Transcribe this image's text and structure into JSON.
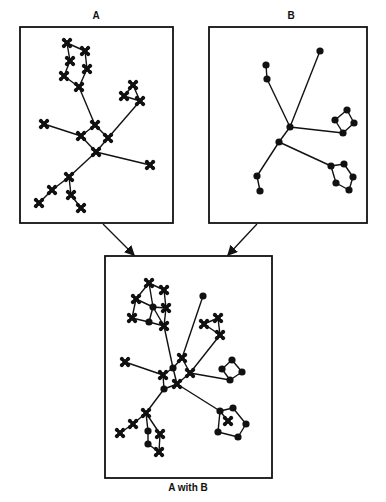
{
  "diagram": {
    "colors": {
      "ink": "#111111",
      "background": "#ffffff"
    },
    "panels": [
      {
        "id": "A",
        "label": "A",
        "box": [
          20,
          27,
          153,
          196
        ],
        "label_pos": [
          96,
          17
        ],
        "nodes": [
          {
            "x": 67,
            "y": 43,
            "t": "x"
          },
          {
            "x": 85,
            "y": 51,
            "t": "x"
          },
          {
            "x": 70,
            "y": 61,
            "t": "x"
          },
          {
            "x": 87,
            "y": 69,
            "t": "x"
          },
          {
            "x": 64,
            "y": 76,
            "t": "x"
          },
          {
            "x": 79,
            "y": 87,
            "t": "x"
          },
          {
            "x": 133,
            "y": 85,
            "t": "x"
          },
          {
            "x": 124,
            "y": 96,
            "t": "x"
          },
          {
            "x": 140,
            "y": 101,
            "t": "x"
          },
          {
            "x": 95,
            "y": 125,
            "t": "x"
          },
          {
            "x": 81,
            "y": 136,
            "t": "x"
          },
          {
            "x": 108,
            "y": 138,
            "t": "x"
          },
          {
            "x": 96,
            "y": 152,
            "t": "x"
          },
          {
            "x": 44,
            "y": 124,
            "t": "x"
          },
          {
            "x": 150,
            "y": 165,
            "t": "x"
          },
          {
            "x": 69,
            "y": 177,
            "t": "x"
          },
          {
            "x": 52,
            "y": 190,
            "t": "x"
          },
          {
            "x": 39,
            "y": 203,
            "t": "x"
          },
          {
            "x": 71,
            "y": 195,
            "t": "x"
          },
          {
            "x": 81,
            "y": 208,
            "t": "x"
          }
        ],
        "edges": [
          [
            0,
            1
          ],
          [
            1,
            3
          ],
          [
            3,
            5
          ],
          [
            5,
            4
          ],
          [
            4,
            2
          ],
          [
            2,
            0
          ],
          [
            5,
            9
          ],
          [
            6,
            7
          ],
          [
            7,
            8
          ],
          [
            8,
            6
          ],
          [
            8,
            11
          ],
          [
            9,
            10
          ],
          [
            9,
            11
          ],
          [
            10,
            12
          ],
          [
            11,
            12
          ],
          [
            10,
            13
          ],
          [
            12,
            14
          ],
          [
            12,
            15
          ],
          [
            15,
            16
          ],
          [
            16,
            17
          ],
          [
            15,
            18
          ],
          [
            18,
            19
          ]
        ]
      },
      {
        "id": "B",
        "label": "B",
        "box": [
          209,
          27,
          158,
          196
        ],
        "label_pos": [
          291,
          17
        ],
        "nodes": [
          {
            "x": 290,
            "y": 127,
            "t": "o"
          },
          {
            "x": 279,
            "y": 142,
            "t": "o"
          },
          {
            "x": 320,
            "y": 51,
            "t": "o"
          },
          {
            "x": 266,
            "y": 65,
            "t": "o"
          },
          {
            "x": 267,
            "y": 79,
            "t": "o"
          },
          {
            "x": 347,
            "y": 110,
            "t": "o"
          },
          {
            "x": 335,
            "y": 120,
            "t": "o"
          },
          {
            "x": 354,
            "y": 123,
            "t": "o"
          },
          {
            "x": 343,
            "y": 133,
            "t": "o"
          },
          {
            "x": 331,
            "y": 166,
            "t": "o"
          },
          {
            "x": 344,
            "y": 164,
            "t": "o"
          },
          {
            "x": 353,
            "y": 177,
            "t": "o"
          },
          {
            "x": 349,
            "y": 190,
            "t": "o"
          },
          {
            "x": 336,
            "y": 183,
            "t": "o"
          },
          {
            "x": 257,
            "y": 176,
            "t": "o"
          },
          {
            "x": 260,
            "y": 191,
            "t": "o"
          }
        ],
        "edges": [
          [
            0,
            1
          ],
          [
            0,
            2
          ],
          [
            0,
            4
          ],
          [
            3,
            4
          ],
          [
            0,
            8
          ],
          [
            5,
            6
          ],
          [
            6,
            8
          ],
          [
            8,
            7
          ],
          [
            7,
            5
          ],
          [
            1,
            9
          ],
          [
            9,
            10
          ],
          [
            10,
            11
          ],
          [
            11,
            12
          ],
          [
            12,
            13
          ],
          [
            13,
            9
          ],
          [
            1,
            14
          ],
          [
            14,
            15
          ]
        ]
      },
      {
        "id": "AB",
        "label": "A with B",
        "box": [
          105,
          256,
          167,
          222
        ],
        "label_pos": [
          188,
          488
        ],
        "nodes": [
          {
            "x": 149,
            "y": 283,
            "t": "x"
          },
          {
            "x": 164,
            "y": 290,
            "t": "x"
          },
          {
            "x": 136,
            "y": 299,
            "t": "x"
          },
          {
            "x": 153,
            "y": 307,
            "t": "o"
          },
          {
            "x": 166,
            "y": 308,
            "t": "x"
          },
          {
            "x": 132,
            "y": 318,
            "t": "x"
          },
          {
            "x": 149,
            "y": 322,
            "t": "o"
          },
          {
            "x": 164,
            "y": 326,
            "t": "x"
          },
          {
            "x": 203,
            "y": 296,
            "t": "o"
          },
          {
            "x": 218,
            "y": 318,
            "t": "x"
          },
          {
            "x": 204,
            "y": 324,
            "t": "x"
          },
          {
            "x": 220,
            "y": 335,
            "t": "x"
          },
          {
            "x": 125,
            "y": 362,
            "t": "x"
          },
          {
            "x": 182,
            "y": 358,
            "t": "x"
          },
          {
            "x": 173,
            "y": 368,
            "t": "o"
          },
          {
            "x": 163,
            "y": 375,
            "t": "x"
          },
          {
            "x": 190,
            "y": 373,
            "t": "x"
          },
          {
            "x": 177,
            "y": 384,
            "t": "x"
          },
          {
            "x": 164,
            "y": 389,
            "t": "o"
          },
          {
            "x": 232,
            "y": 360,
            "t": "o"
          },
          {
            "x": 222,
            "y": 369,
            "t": "o"
          },
          {
            "x": 242,
            "y": 372,
            "t": "o"
          },
          {
            "x": 230,
            "y": 380,
            "t": "o"
          },
          {
            "x": 146,
            "y": 413,
            "t": "x"
          },
          {
            "x": 133,
            "y": 424,
            "t": "x"
          },
          {
            "x": 120,
            "y": 433,
            "t": "x"
          },
          {
            "x": 148,
            "y": 431,
            "t": "o"
          },
          {
            "x": 160,
            "y": 434,
            "t": "x"
          },
          {
            "x": 148,
            "y": 444,
            "t": "o"
          },
          {
            "x": 159,
            "y": 452,
            "t": "x"
          },
          {
            "x": 220,
            "y": 411,
            "t": "o"
          },
          {
            "x": 233,
            "y": 408,
            "t": "o"
          },
          {
            "x": 246,
            "y": 424,
            "t": "o"
          },
          {
            "x": 238,
            "y": 437,
            "t": "o"
          },
          {
            "x": 218,
            "y": 432,
            "t": "o"
          },
          {
            "x": 228,
            "y": 421,
            "t": "x"
          }
        ],
        "edges": [
          [
            0,
            1
          ],
          [
            0,
            2
          ],
          [
            0,
            3
          ],
          [
            1,
            4
          ],
          [
            2,
            3
          ],
          [
            2,
            5
          ],
          [
            3,
            4
          ],
          [
            3,
            6
          ],
          [
            4,
            7
          ],
          [
            5,
            6
          ],
          [
            6,
            7
          ],
          [
            3,
            7
          ],
          [
            7,
            14
          ],
          [
            8,
            13
          ],
          [
            9,
            10
          ],
          [
            9,
            11
          ],
          [
            10,
            11
          ],
          [
            11,
            16
          ],
          [
            12,
            15
          ],
          [
            13,
            14
          ],
          [
            14,
            15
          ],
          [
            13,
            16
          ],
          [
            15,
            18
          ],
          [
            16,
            17
          ],
          [
            17,
            18
          ],
          [
            14,
            17
          ],
          [
            16,
            22
          ],
          [
            19,
            20
          ],
          [
            20,
            22
          ],
          [
            22,
            21
          ],
          [
            21,
            19
          ],
          [
            18,
            23
          ],
          [
            23,
            24
          ],
          [
            24,
            25
          ],
          [
            23,
            26
          ],
          [
            23,
            27
          ],
          [
            26,
            28
          ],
          [
            27,
            29
          ],
          [
            28,
            29
          ],
          [
            17,
            30
          ],
          [
            30,
            31
          ],
          [
            31,
            32
          ],
          [
            32,
            33
          ],
          [
            33,
            34
          ],
          [
            34,
            30
          ],
          [
            30,
            35
          ]
        ]
      }
    ],
    "arrows": [
      {
        "from": [
          103,
          224
        ],
        "to": [
          134,
          255
        ]
      },
      {
        "from": [
          257,
          224
        ],
        "to": [
          228,
          255
        ]
      }
    ]
  }
}
